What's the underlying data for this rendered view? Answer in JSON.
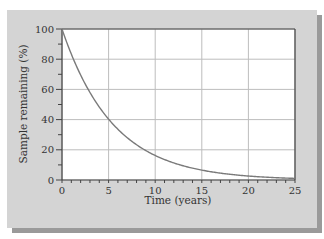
{
  "chart_data": {
    "type": "line",
    "title": "",
    "xlabel": "Time (years)",
    "ylabel": "Sample remaining (%)",
    "xlim": [
      0,
      25
    ],
    "ylim": [
      0,
      100
    ],
    "xticks": [
      0,
      5,
      10,
      15,
      20,
      25
    ],
    "yticks": [
      0,
      20,
      40,
      60,
      80,
      100
    ],
    "grid": true,
    "legend": null,
    "series": [
      {
        "name": "Sample remaining",
        "color": "#7a7a7a",
        "x": [
          0,
          1,
          2,
          3,
          4,
          5,
          6,
          7,
          8,
          9,
          10,
          11,
          12,
          13,
          14,
          15,
          16,
          17,
          18,
          19,
          20,
          21,
          22,
          23,
          24,
          25
        ],
        "y": [
          100,
          83,
          69,
          58,
          48,
          40,
          34,
          28,
          23,
          19,
          16,
          13,
          11,
          9,
          8,
          6.5,
          5.5,
          4.5,
          3.8,
          3.1,
          2.6,
          2.2,
          1.8,
          1.5,
          1.2,
          1.0
        ]
      }
    ]
  },
  "colors": {
    "panel": "#d4d4d4",
    "plot_bg": "#ffffff",
    "grid": "#bdbdbd",
    "axis": "#444444",
    "curve": "#7a7a7a"
  }
}
